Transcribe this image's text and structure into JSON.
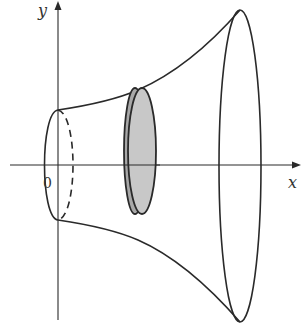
{
  "diagram": {
    "type": "solid-of-revolution",
    "labels": {
      "y_axis": "y",
      "x_axis": "x",
      "origin": "0"
    },
    "colors": {
      "stroke": "#2a2a2a",
      "disk_fill": "#c8c8c8",
      "disk_rim": "#a8a8a8",
      "background": "#ffffff"
    },
    "elements": [
      "y-axis with arrow",
      "x-axis with arrow",
      "small ellipse at origin (front solid, back dashed)",
      "shaded disk cross-section",
      "large ellipse at right end",
      "upper profile curve",
      "lower profile curve"
    ]
  }
}
